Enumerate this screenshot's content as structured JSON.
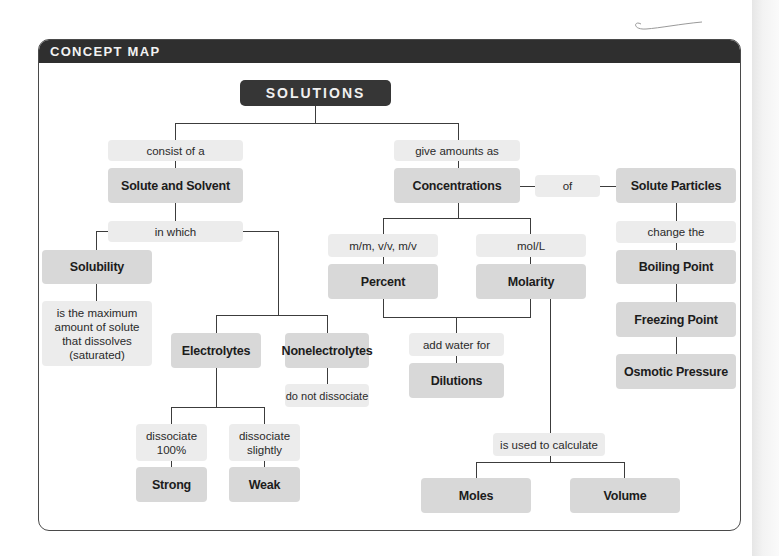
{
  "header": {
    "title": "CONCEPT MAP"
  },
  "root": {
    "label": "SOLUTIONS"
  },
  "left_branch": {
    "link_consist": "consist of a",
    "solute_solvent": "Solute and Solvent",
    "link_in_which": "in which",
    "solubility": "Solubility",
    "solubility_desc": "is the maximum amount of solute that dissolves (saturated)",
    "electrolytes": "Electrolytes",
    "nonelectrolytes": "Nonelectrolytes",
    "link_do_not_dissociate": "do not dissociate",
    "link_dissociate_100": "dissociate 100%",
    "link_dissociate_slightly": "dissociate slightly",
    "strong": "Strong",
    "weak": "Weak"
  },
  "right_branch": {
    "link_give_amounts": "give amounts as",
    "concentrations": "Concentrations",
    "link_of": "of",
    "solute_particles": "Solute Particles",
    "link_percent_units": "m/m, v/v, m/v",
    "link_molarity_units": "mol/L",
    "percent": "Percent",
    "molarity": "Molarity",
    "link_add_water": "add water for",
    "dilutions": "Dilutions",
    "link_change_the": "change the",
    "boiling_point": "Boiling Point",
    "freezing_point": "Freezing Point",
    "osmotic_pressure": "Osmotic Pressure",
    "link_used_to_calculate": "is used to calculate",
    "moles": "Moles",
    "volume": "Volume"
  },
  "colors": {
    "header_bg": "#2f2f2f",
    "root_bg": "#363636",
    "concept_bg": "#d8d8d8",
    "link_bg": "#ececec",
    "line": "#3c3c3c"
  }
}
